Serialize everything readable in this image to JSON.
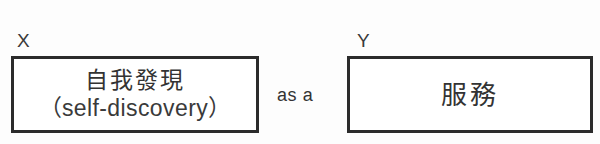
{
  "diagram": {
    "type": "term-relation",
    "colors": {
      "background": "#fdfdfd",
      "box_border": "#2b2b2b",
      "box_fill": "#ffffff",
      "text": "#333333"
    },
    "left_term": {
      "variable_label": "X",
      "box_text_primary": "自我發現",
      "box_text_secondary": "（self-discovery）"
    },
    "connector": {
      "label": "as a"
    },
    "right_term": {
      "variable_label": "Y",
      "box_text_primary": "服務"
    }
  }
}
